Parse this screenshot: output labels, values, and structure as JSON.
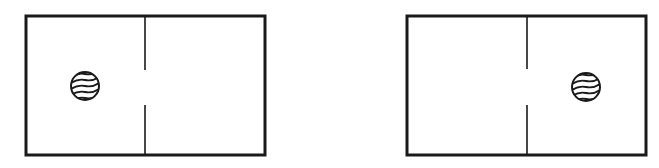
{
  "diagram": {
    "colors": {
      "stroke": "#1a1a1a",
      "background": "#ffffff"
    },
    "panels": [
      {
        "id": "left-panel",
        "box": {
          "x": 26,
          "y": 16,
          "w": 239,
          "h": 139
        },
        "divider_x": 145,
        "gap": {
          "top": 70,
          "bottom": 105
        },
        "ball": {
          "cx": 85,
          "cy": 86,
          "r": 14,
          "compartment": "left"
        }
      },
      {
        "id": "right-panel",
        "box": {
          "x": 407,
          "y": 16,
          "w": 239,
          "h": 139
        },
        "divider_x": 527,
        "gap": {
          "top": 69,
          "bottom": 105
        },
        "ball": {
          "cx": 586,
          "cy": 87,
          "r": 14,
          "compartment": "right"
        }
      }
    ]
  }
}
